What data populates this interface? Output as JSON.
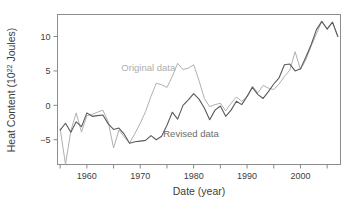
{
  "chart_data": {
    "type": "line",
    "title": "",
    "xlabel": "Date (year)",
    "ylabel_main": "Heat Content (10",
    "ylabel_exp": "22",
    "ylabel_tail": " Joules)",
    "ylabel_full": "Heat Content (10^22 Joules)",
    "xlim": [
      1954.5,
      2007.5
    ],
    "ylim": [
      -8.6,
      13.2
    ],
    "xticks": [
      1960,
      1970,
      1980,
      1990,
      2000
    ],
    "xticklabels": [
      "1960",
      "1970",
      "1980",
      "1990",
      "2000"
    ],
    "xticks_minor": [
      1955,
      1965,
      1975,
      1985,
      1995,
      2005
    ],
    "yticks": [
      -5,
      0,
      5,
      10
    ],
    "yticklabels": [
      "−5",
      "0",
      "5",
      "10"
    ],
    "grid": false,
    "legend_position": "inline-annotation",
    "annotations": [
      {
        "text": "Original data",
        "x": 1971.5,
        "y": 5.0,
        "color": "#b4b4b4"
      },
      {
        "text": "Revised data",
        "x": 1979.5,
        "y": -4.6,
        "color": "#6b6b6b"
      }
    ],
    "series": [
      {
        "name": "Original data",
        "color": "#b0b0b0",
        "linewidth": 1.0,
        "x": [
          1955,
          1956,
          1957,
          1958,
          1959,
          1960,
          1961,
          1962,
          1963,
          1964,
          1965,
          1966,
          1967,
          1968,
          1969,
          1970,
          1971,
          1972,
          1973,
          1974,
          1975,
          1976,
          1977,
          1978,
          1979,
          1980,
          1981,
          1982,
          1983,
          1984,
          1985,
          1986,
          1987,
          1988,
          1989,
          1990,
          1991,
          1992,
          1993,
          1994,
          1995,
          1996,
          1997,
          1998,
          1999,
          2000,
          2001,
          2002,
          2003,
          2004,
          2005,
          2006,
          2007
        ],
        "y": [
          -3.4,
          -8.6,
          -3.7,
          -1.1,
          -3.9,
          -1.5,
          -1.3,
          -1.0,
          -0.7,
          -2.4,
          -6.2,
          -3.6,
          -4.6,
          -5.5,
          -4.1,
          -2.6,
          -0.9,
          1.3,
          3.2,
          3.0,
          2.6,
          4.2,
          6.1,
          5.2,
          5.4,
          5.9,
          3.6,
          1.0,
          -0.2,
          0.1,
          0.3,
          -0.8,
          0.3,
          1.2,
          0.6,
          1.2,
          2.8,
          1.8,
          2.9,
          2.5,
          2.3,
          3.1,
          4.2,
          5.1,
          7.8,
          5.2,
          6.6,
          8.6,
          10.4,
          12.2,
          11.0,
          12.1,
          10.0
        ]
      },
      {
        "name": "Revised data",
        "color": "#5a5a5a",
        "linewidth": 1.1,
        "x": [
          1955,
          1956,
          1957,
          1958,
          1959,
          1960,
          1961,
          1962,
          1963,
          1964,
          1965,
          1966,
          1967,
          1968,
          1969,
          1970,
          1971,
          1972,
          1973,
          1974,
          1975,
          1976,
          1977,
          1978,
          1979,
          1980,
          1981,
          1982,
          1983,
          1984,
          1985,
          1986,
          1987,
          1988,
          1989,
          1990,
          1991,
          1992,
          1993,
          1994,
          1995,
          1996,
          1997,
          1998,
          1999,
          2000,
          2001,
          2002,
          2003,
          2004,
          2005,
          2006,
          2007
        ],
        "y": [
          -3.6,
          -2.6,
          -3.9,
          -2.4,
          -3.1,
          -1.1,
          -1.6,
          -1.5,
          -1.4,
          -2.7,
          -3.5,
          -3.3,
          -4.2,
          -5.5,
          -5.3,
          -5.2,
          -5.1,
          -4.4,
          -5.0,
          -4.5,
          -2.9,
          -1.0,
          -2.0,
          0.0,
          0.8,
          1.7,
          0.9,
          -0.4,
          -2.1,
          -0.7,
          -0.1,
          -1.6,
          -0.7,
          0.6,
          0.1,
          1.3,
          2.6,
          1.6,
          1.0,
          2.0,
          3.1,
          4.0,
          5.9,
          6.0,
          5.0,
          5.3,
          7.0,
          8.8,
          11.0,
          12.2,
          11.1,
          12.1,
          10.0
        ]
      }
    ]
  },
  "axes": {
    "box_color": "#888888",
    "tick_color": "#888888",
    "text_color": "#3d3d3d"
  }
}
